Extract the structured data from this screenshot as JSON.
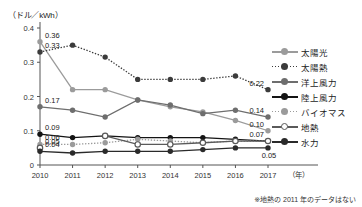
{
  "unit_label": "（ドル／kWh）",
  "note": "※地熱の 2011 年のデータはない",
  "axis": {
    "y_ticks": [
      "0",
      "0.1",
      "0.2",
      "0.3",
      "0.4"
    ],
    "y_values": [
      0,
      0.1,
      0.2,
      0.3,
      0.4
    ],
    "x_ticks": [
      "2010",
      "2011",
      "2012",
      "2013",
      "2014",
      "2015",
      "2016",
      "2017"
    ],
    "x_unit": "（年）"
  },
  "legend": {
    "items": [
      {
        "label": "太陽光",
        "color": "#9b9b9b",
        "style": "solid",
        "fill": "solid"
      },
      {
        "label": "太陽熱",
        "color": "#3b3b3b",
        "style": "dotted",
        "fill": "solid"
      },
      {
        "label": "洋上風力",
        "color": "#6e6e6e",
        "style": "solid",
        "fill": "solid"
      },
      {
        "label": "陸上風力",
        "color": "#141414",
        "style": "solid",
        "fill": "solid"
      },
      {
        "label": "バイオマス",
        "color": "#9b9b9b",
        "style": "dotted",
        "fill": "solid"
      },
      {
        "label": "地熱",
        "color": "#5a5a5a",
        "style": "solid",
        "fill": "open"
      },
      {
        "label": "水力",
        "color": "#2a2a2a",
        "style": "solid",
        "fill": "solid"
      }
    ]
  },
  "value_labels": {
    "left": [
      {
        "text": "0.36",
        "series": "太陽光",
        "x": 2010,
        "y": 0.36
      },
      {
        "text": "0.33",
        "series": "太陽熱",
        "x": 2010,
        "y": 0.33
      },
      {
        "text": "0.17",
        "series": "洋上風力",
        "x": 2010,
        "y": 0.17
      },
      {
        "text": "0.09",
        "series": "陸上風力",
        "x": 2010,
        "y": 0.09
      },
      {
        "text": "0.06",
        "series": "バイオマス",
        "x": 2010,
        "y": 0.06
      },
      {
        "text": "0.05",
        "series": "地熱",
        "x": 2010,
        "y": 0.05
      },
      {
        "text": "0.04",
        "series": "水力",
        "x": 2010,
        "y": 0.04
      }
    ],
    "right": [
      {
        "text": "0.22",
        "series": "太陽熱",
        "x": 2017,
        "y": 0.22
      },
      {
        "text": "0.14",
        "series": "洋上風力",
        "x": 2017,
        "y": 0.14
      },
      {
        "text": "0.10",
        "series": "太陽光",
        "x": 2017,
        "y": 0.1
      },
      {
        "text": "0.07",
        "series": "地熱",
        "x": 2017,
        "y": 0.07
      },
      {
        "text": "0.05",
        "series": "水力",
        "x": 2017,
        "y": 0.05
      }
    ]
  },
  "chart_data": {
    "type": "line",
    "title": "",
    "xlabel": "（年）",
    "ylabel": "（ドル／kWh）",
    "x": [
      2010,
      2011,
      2012,
      2013,
      2014,
      2015,
      2016,
      2017
    ],
    "ylim": [
      0,
      0.4
    ],
    "xlim": [
      2010,
      2017
    ],
    "grid": false,
    "legend_position": "right",
    "series": [
      {
        "name": "太陽光",
        "color": "#9b9b9b",
        "style": "solid",
        "marker": "solid",
        "values": [
          0.36,
          0.22,
          0.22,
          0.19,
          0.17,
          0.155,
          0.13,
          0.1
        ]
      },
      {
        "name": "太陽熱",
        "color": "#3b3b3b",
        "style": "dotted",
        "marker": "solid",
        "values": [
          0.33,
          0.35,
          0.315,
          0.25,
          0.25,
          0.25,
          0.26,
          0.22
        ]
      },
      {
        "name": "洋上風力",
        "color": "#6e6e6e",
        "style": "solid",
        "marker": "solid",
        "values": [
          0.17,
          0.16,
          0.14,
          0.19,
          0.175,
          0.15,
          0.16,
          0.14
        ]
      },
      {
        "name": "陸上風力",
        "color": "#141414",
        "style": "solid",
        "marker": "solid",
        "values": [
          0.09,
          0.08,
          0.085,
          0.08,
          0.08,
          0.08,
          0.075,
          0.07
        ]
      },
      {
        "name": "バイオマス",
        "color": "#9b9b9b",
        "style": "dotted",
        "marker": "solid",
        "values": [
          0.06,
          0.06,
          0.065,
          0.075,
          0.07,
          0.065,
          0.07,
          0.07
        ]
      },
      {
        "name": "地熱",
        "color": "#5a5a5a",
        "style": "solid",
        "marker": "open",
        "values": [
          0.05,
          null,
          0.085,
          0.06,
          0.06,
          0.065,
          0.07,
          0.07
        ]
      },
      {
        "name": "水力",
        "color": "#2a2a2a",
        "style": "solid",
        "marker": "solid",
        "values": [
          0.04,
          0.035,
          0.04,
          0.04,
          0.04,
          0.045,
          0.05,
          0.05
        ]
      }
    ]
  }
}
